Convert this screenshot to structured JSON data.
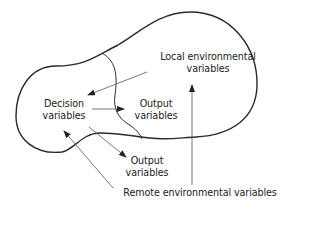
{
  "diagram": {
    "labels": {
      "local_env_line1": "Local environmental",
      "local_env_line2": "variables",
      "decision_line1": "Decision",
      "decision_line2": "variables",
      "output1_line1": "Output",
      "output1_line2": "variables",
      "output2_line1": "Output",
      "output2_line2": "variables",
      "remote_env": "Remote environmental variables"
    },
    "colors": {
      "outline": "#2a2a2a",
      "arrow": "#555555",
      "text": "#222222"
    }
  }
}
